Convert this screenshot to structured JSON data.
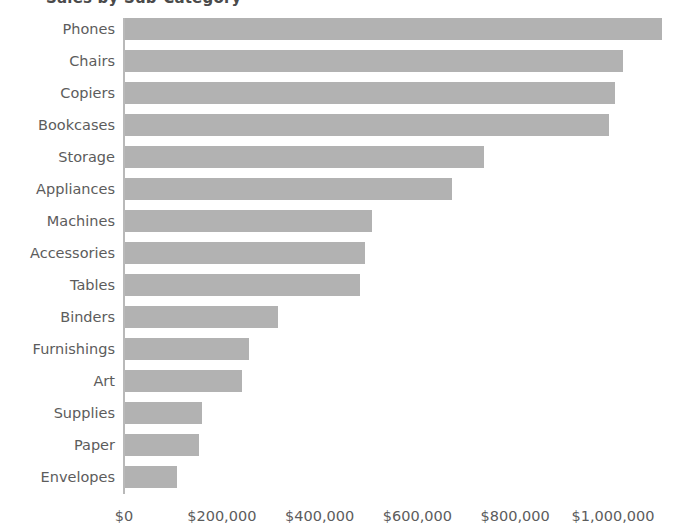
{
  "chart_data": {
    "type": "bar",
    "orientation": "horizontal",
    "title": "Sales by Sub-Category",
    "xlabel": "",
    "ylabel": "",
    "grid": false,
    "legend": "none",
    "xlim": [
      0,
      1120000
    ],
    "xticks": [
      0,
      200000,
      400000,
      600000,
      800000,
      1000000
    ],
    "xtick_labels": [
      "$0",
      "$200,000",
      "$400,000",
      "$600,000",
      "$800,000",
      "$1,000,000"
    ],
    "categories": [
      "Phones",
      "Chairs",
      "Copiers",
      "Bookcases",
      "Storage",
      "Appliances",
      "Machines",
      "Accessories",
      "Tables",
      "Binders",
      "Furnishings",
      "Art",
      "Supplies",
      "Paper",
      "Envelopes"
    ],
    "values": [
      1098000,
      1018000,
      1002000,
      990000,
      734000,
      668000,
      505000,
      491000,
      480000,
      313000,
      253000,
      239000,
      157000,
      151000,
      106000
    ],
    "bar_color": "#b2b2b2",
    "text_color": "#5c5c5c",
    "axis_color": "#b9b9b9",
    "background_color": "#ffffff"
  }
}
